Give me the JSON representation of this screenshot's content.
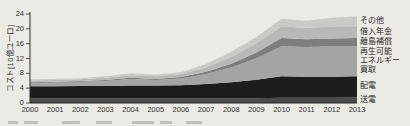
{
  "page": {
    "background_color": "#ebeae5"
  },
  "chart_data": {
    "type": "area",
    "stacked": true,
    "title": "",
    "xlabel": "",
    "ylabel": "コスト[10億ユーロ]",
    "ylim": [
      0,
      24
    ],
    "yticks": [
      "0",
      "4",
      "8",
      "12",
      "16",
      "20",
      "24"
    ],
    "grid": false,
    "legend_position": "right",
    "categories": [
      "2000",
      "2001",
      "2002",
      "2003",
      "2004",
      "2005",
      "2006",
      "2007",
      "2008",
      "2009",
      "2010",
      "2011",
      "2012",
      "2013"
    ],
    "series": [
      {
        "name": "送電",
        "color": "#4b4b47",
        "values": [
          1.3,
          1.3,
          1.3,
          1.3,
          1.3,
          1.3,
          1.3,
          1.3,
          1.3,
          1.3,
          1.4,
          1.4,
          1.4,
          1.5
        ]
      },
      {
        "name": "配電",
        "color": "#1d1d1b",
        "values": [
          3.2,
          3.2,
          3.3,
          3.3,
          3.4,
          3.4,
          3.5,
          3.8,
          4.3,
          5.0,
          5.8,
          5.7,
          5.7,
          5.7
        ]
      },
      {
        "name": "再生可能エネルギー買取",
        "color": "#a4a4a0",
        "values": [
          0.9,
          1.0,
          1.1,
          1.3,
          1.8,
          1.5,
          1.8,
          2.7,
          4.0,
          5.8,
          8.1,
          8.0,
          8.2,
          8.1
        ]
      },
      {
        "name": "離島補償",
        "color": "#7e7e7a",
        "values": [
          0.2,
          0.2,
          0.2,
          0.3,
          0.3,
          0.3,
          0.4,
          0.6,
          1.0,
          1.5,
          2.2,
          2.1,
          2.1,
          2.2
        ]
      },
      {
        "name": "借入年金",
        "color": "#b8b8b4",
        "values": [
          0.5,
          0.5,
          0.5,
          0.6,
          0.7,
          0.7,
          0.8,
          1.2,
          1.8,
          2.5,
          3.2,
          3.0,
          3.2,
          3.2
        ]
      },
      {
        "name": "その他",
        "color": "#cbcbc6",
        "values": [
          0.3,
          0.3,
          0.3,
          0.4,
          0.5,
          0.5,
          0.5,
          0.9,
          1.4,
          1.7,
          2.0,
          2.0,
          2.4,
          2.7
        ]
      }
    ],
    "legend_entries": [
      {
        "series_index": 5,
        "lines": [
          "その他"
        ]
      },
      {
        "series_index": 4,
        "lines": [
          "借入年金"
        ]
      },
      {
        "series_index": 3,
        "lines": [
          "離島補償"
        ]
      },
      {
        "series_index": 2,
        "lines": [
          "再生可能",
          "エネルギー",
          "買取"
        ]
      },
      {
        "series_index": 1,
        "lines": [
          "配電"
        ]
      },
      {
        "series_index": 0,
        "lines": [
          "送電"
        ]
      }
    ],
    "axis_color": "#2a2a28"
  }
}
